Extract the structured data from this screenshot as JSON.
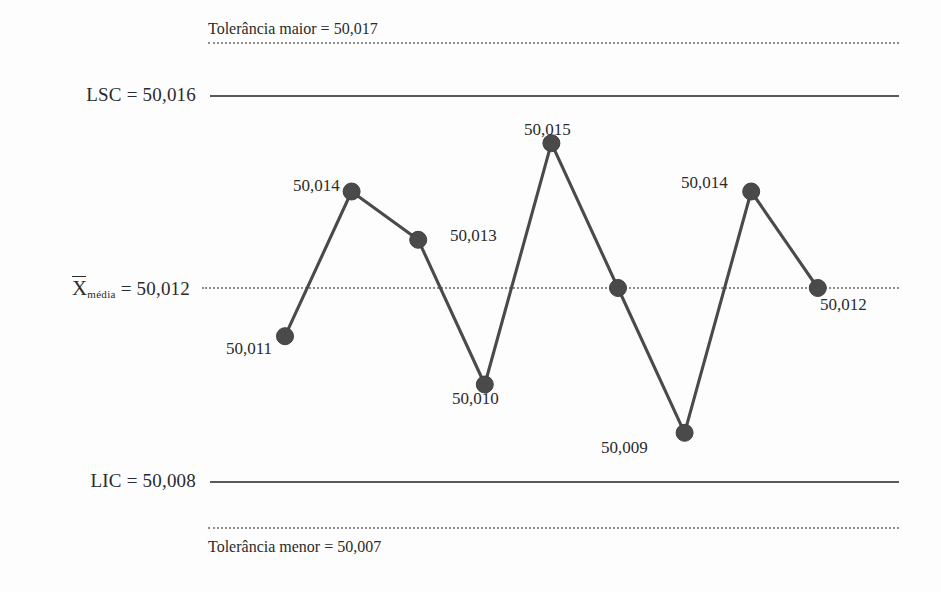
{
  "chart_data": {
    "type": "line",
    "title": "",
    "subtitle": "",
    "xlabel": "",
    "ylabel": "",
    "grid": false,
    "legend": "none",
    "decimal_separator": ",",
    "x": [
      1,
      2,
      3,
      4,
      5,
      6,
      7,
      8,
      9
    ],
    "values": [
      50.011,
      50.014,
      50.013,
      50.01,
      50.015,
      50.012,
      50.009,
      50.014,
      50.012
    ],
    "point_labels": [
      "50,011",
      "50,014",
      "50,013",
      "50,010",
      "50,015",
      "50,012",
      "50,009",
      "50,014",
      "50,012"
    ],
    "ylim": [
      50.006,
      50.018
    ],
    "series": [
      {
        "name": "medidas",
        "values": [
          50.011,
          50.014,
          50.013,
          50.01,
          50.015,
          50.012,
          50.009,
          50.014,
          50.012
        ]
      }
    ],
    "reference_lines": [
      {
        "id": "tolerancia_maior",
        "label": "Tolerância maior = 50,017",
        "value": 50.017,
        "style": "dotted"
      },
      {
        "id": "lsc",
        "label": "LSC = 50,016",
        "value": 50.016,
        "style": "solid"
      },
      {
        "id": "media",
        "label": "X̄média = 50,012",
        "value": 50.012,
        "style": "dotted"
      },
      {
        "id": "lic",
        "label": "LIC = 50,008",
        "value": 50.008,
        "style": "solid"
      },
      {
        "id": "tolerancia_menor",
        "label": "Tolerância menor = 50,007",
        "value": 50.007,
        "style": "dotted"
      }
    ]
  },
  "labels": {
    "tolerancia_maior": "Tolerância maior = 50,017",
    "tolerancia_menor": "Tolerância menor = 50,007",
    "lsc": "LSC = 50,016",
    "lic": "LIC = 50,008",
    "media_symbol": "X",
    "media_subscript": "média",
    "media_value": "= 50,012"
  },
  "points": [
    {
      "label": "50,011"
    },
    {
      "label": "50,014"
    },
    {
      "label": "50,013"
    },
    {
      "label": "50,010"
    },
    {
      "label": "50,015"
    },
    {
      "label": "50,012"
    },
    {
      "label": "50,009"
    },
    {
      "label": "50,014"
    },
    {
      "label": "50,012"
    }
  ],
  "colors": {
    "series": "#4a4a4a",
    "control_line": "#5a5a5a",
    "tolerance_line": "#8d8d8d",
    "text": "#2b2b2b",
    "background": "#fdfdfd"
  }
}
